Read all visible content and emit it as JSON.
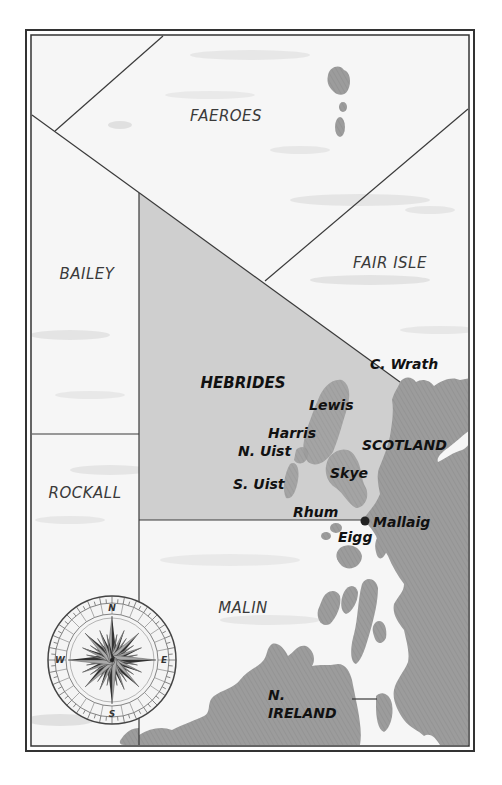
{
  "colors": {
    "sea": "#f4f4f4",
    "sea_streak": "#d6d6d6",
    "hebrides_fill": "#cfcfcf",
    "land": "#9a9a9a",
    "land_highlight": "#a6a6a6",
    "border": "#3a3a3a",
    "text": "#111111",
    "area_text": "#3a3a3a"
  },
  "sea_areas": [
    {
      "id": "faeroes",
      "name": "FAEROES",
      "highlighted": false
    },
    {
      "id": "fair-isle",
      "name": "FAIR ISLE",
      "highlighted": false
    },
    {
      "id": "bailey",
      "name": "BAILEY",
      "highlighted": false
    },
    {
      "id": "hebrides",
      "name": "HEBRIDES",
      "highlighted": true
    },
    {
      "id": "rockall",
      "name": "ROCKALL",
      "highlighted": false
    },
    {
      "id": "malin",
      "name": "MALIN",
      "highlighted": false
    }
  ],
  "places": {
    "c_wrath": "C. Wrath",
    "lewis": "Lewis",
    "harris": "Harris",
    "n_uist": "N. Uist",
    "s_uist": "S. Uist",
    "skye": "Skye",
    "rhum": "Rhum",
    "eigg": "Eigg",
    "mallaig": "Mallaig",
    "scotland": "SCOTLAND",
    "n_ireland_line1": "N.",
    "n_ireland_line2": "IRELAND"
  },
  "compass": {
    "north": "N",
    "east": "E",
    "south": "S",
    "west": "W"
  }
}
